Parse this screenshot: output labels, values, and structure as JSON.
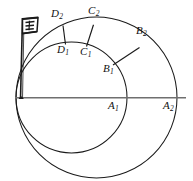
{
  "figure": {
    "background_color": "#ffffff",
    "stroke_color": "#1a1a1a",
    "axis_color": "#6b6b6b",
    "width": 193,
    "height": 181
  },
  "axis": {
    "name": "horizontal-diameter-line",
    "x1": 15,
    "y1": 98,
    "x2": 186,
    "y2": 98
  },
  "circles": [
    {
      "name": "outer-circle",
      "cx": 96.5,
      "cy": 97.5,
      "r": 80.5
    },
    {
      "name": "inner-circle",
      "cx": 71.5,
      "cy": 97.5,
      "r": 55.5
    }
  ],
  "tangent_point": {
    "x": 16,
    "y": 97.5
  },
  "radial_segments": [
    {
      "name": "segment-D",
      "x1": 65,
      "y1": 43.5,
      "x2": 62.5,
      "y2": 25.5
    },
    {
      "name": "segment-C",
      "x1": 86.5,
      "y1": 45.5,
      "x2": 93.5,
      "y2": 24.5
    },
    {
      "name": "segment-B",
      "x1": 113.5,
      "y1": 64.5,
      "x2": 139.5,
      "y2": 47.5
    }
  ],
  "labels": [
    {
      "id": "D2",
      "base": "D",
      "sub": "2",
      "x": 51,
      "y": 10
    },
    {
      "id": "C2",
      "base": "C",
      "sub": "2",
      "x": 88,
      "y": 7
    },
    {
      "id": "B2",
      "base": "B",
      "sub": "2",
      "x": 136,
      "y": 27
    },
    {
      "id": "D1",
      "base": "D",
      "sub": "1",
      "x": 58,
      "y": 45
    },
    {
      "id": "C1",
      "base": "C",
      "sub": "1",
      "x": 81,
      "y": 47
    },
    {
      "id": "B1",
      "base": "B",
      "sub": "1",
      "x": 104,
      "y": 64
    },
    {
      "id": "A1",
      "base": "A",
      "sub": "1",
      "x": 108,
      "y": 100
    },
    {
      "id": "A2",
      "base": "A",
      "sub": "2",
      "x": 163,
      "y": 100
    }
  ],
  "flag": {
    "name": "flag-icon",
    "pole_x": 22,
    "pole_top_y": 17,
    "pole_bottom_y": 99,
    "banner_x": 22,
    "banner_y": 18,
    "banner_w": 16,
    "banner_h": 15
  }
}
